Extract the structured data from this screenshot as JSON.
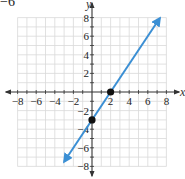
{
  "corner_fragment": "−6",
  "chart_data": {
    "type": "line",
    "title": "",
    "xlabel": "x",
    "ylabel": "y",
    "xlim": [
      -8,
      8
    ],
    "ylim": [
      -8,
      8
    ],
    "grid": true,
    "x_ticks": [
      -8,
      -6,
      -4,
      -2,
      2,
      4,
      6,
      8
    ],
    "y_ticks": [
      -8,
      -6,
      -4,
      -2,
      2,
      4,
      6,
      8
    ],
    "x_tick_labels": [
      "−8",
      "−6",
      "−4",
      "−2",
      "2",
      "4",
      "6",
      "8"
    ],
    "y_tick_labels": [
      "8",
      "6",
      "4",
      "2",
      "−2",
      "−4",
      "−6",
      "−8"
    ],
    "series": [
      {
        "name": "y = 1.5x − 3",
        "color": "#3b8fd4",
        "slope": 1.5,
        "intercept": -3,
        "arrows": "both",
        "x_start": -3,
        "x_end": 7.3
      }
    ],
    "points": [
      {
        "x": 0,
        "y": -3,
        "label": "y-intercept"
      },
      {
        "x": 2,
        "y": 0,
        "label": "x-intercept"
      }
    ]
  },
  "colors": {
    "grid": "#d9d9d9",
    "axis": "#333333",
    "line": "#3b8fd4",
    "point": "#111111"
  }
}
